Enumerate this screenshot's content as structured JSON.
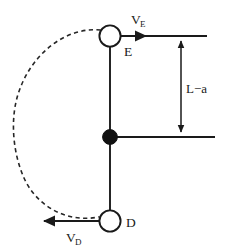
{
  "figure": {
    "type": "physics-diagram",
    "background_color": "#ffffff",
    "line_color": "#1a1a1a",
    "labels": {
      "node_top": "E",
      "node_bottom": "D",
      "velocity_top": "V",
      "velocity_top_sub": "E",
      "velocity_bottom": "V",
      "velocity_bottom_sub": "D",
      "dimension": "L−a"
    },
    "nodes": [
      {
        "name": "E",
        "style": "open-circle",
        "cx": 110,
        "cy": 36,
        "r": 11
      },
      {
        "name": "pivot",
        "style": "filled-circle",
        "cx": 110,
        "cy": 137,
        "r": 7.5
      },
      {
        "name": "D",
        "style": "open-circle",
        "cx": 110,
        "cy": 221,
        "r": 11
      }
    ],
    "arc": {
      "style": "dashed",
      "from": "E",
      "to": "D",
      "bulge_direction": "left",
      "leftmost_x": 13
    },
    "reference_lines": [
      {
        "name": "top-reference-line",
        "y": 36,
        "x1": 121,
        "x2": 207
      },
      {
        "name": "pivot-reference-line",
        "y": 137,
        "x1": 118,
        "x2": 215
      }
    ],
    "dimension_line": {
      "x": 181,
      "y1": 36,
      "y2": 137,
      "label": "L−a"
    },
    "vectors": [
      {
        "name": "V_E",
        "direction": "right",
        "x1": 121,
        "x2": 150,
        "y": 36
      },
      {
        "name": "V_D",
        "direction": "left",
        "x1": 99,
        "x2": 40,
        "y": 221
      }
    ]
  }
}
